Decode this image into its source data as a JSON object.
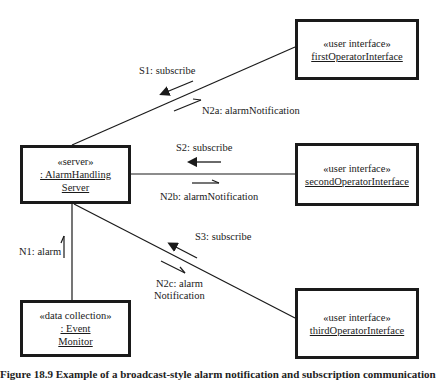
{
  "objects": {
    "first": {
      "stereotype": "«user interface»",
      "name": "firstOperatorInterface"
    },
    "server": {
      "stereotype": "«server»",
      "name_line1": ": AlarmHandling",
      "name_line2": "Server"
    },
    "second": {
      "stereotype": "«user interface»",
      "name": "secondOperatorInterface"
    },
    "third": {
      "stereotype": "«user interface»",
      "name": "thirdOperatorInterface"
    },
    "monitor": {
      "stereotype": "«data collection»",
      "name_line1": ": Event",
      "name_line2": "Monitor"
    }
  },
  "messages": {
    "s1": "S1: subscribe",
    "n2a": "N2a: alarmNotification",
    "s2": "S2: subscribe",
    "n2b": "N2b: alarmNotification",
    "s3": "S3: subscribe",
    "n2c_line1": "N2c: alarm",
    "n2c_line2": "Notification",
    "n1": "N1: alarm"
  },
  "caption": "Figure 18.9  Example of a broadcast-style alarm notification and subscription communication"
}
